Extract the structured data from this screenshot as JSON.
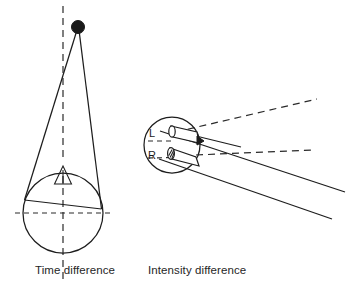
{
  "figure": {
    "background_color": "#ffffff",
    "ink_color": "#1d1d1d",
    "width": 360,
    "height": 287
  },
  "panels": [
    {
      "id": "time-difference",
      "caption": "Time difference",
      "caption_position": {
        "x": 35,
        "y": 272
      },
      "description": "Sound source above a head seen from above; two path lines of unequal length reach the two ears",
      "elements": {
        "source_dot": {
          "name": "sound-source-dot",
          "cx": 78,
          "cy": 27,
          "r": 6.5,
          "color": "#1a1a1a"
        },
        "midline": {
          "name": "vertical-midline",
          "x": 63,
          "y1": 6,
          "y2": 283,
          "style": "dashed"
        },
        "head_circle": {
          "name": "head-outline",
          "cx": 63,
          "cy": 213,
          "r": 40,
          "style": "solid"
        },
        "horizontal_axis": {
          "name": "interaural-axis",
          "y": 213,
          "x1": 15,
          "x2": 112,
          "style": "dashed"
        },
        "nose_triangle": {
          "name": "nose-marker",
          "apex_x": 63,
          "apex_y": 166,
          "base_left_x": 55,
          "base_right_x": 71,
          "base_y": 183
        },
        "path_left": {
          "name": "sound-path-left-ear",
          "from": [
            78,
            27
          ],
          "to": [
            25,
            199
          ]
        },
        "path_right": {
          "name": "sound-path-right-ear",
          "from": [
            78,
            27
          ],
          "to": [
            101,
            208
          ]
        },
        "interaural_chord": {
          "name": "interaural-chord",
          "from": [
            25,
            199
          ],
          "to": [
            101,
            208
          ]
        }
      }
    },
    {
      "id": "intensity-difference",
      "caption": "Intensity difference",
      "caption_position": {
        "x": 148,
        "y": 272
      },
      "description": "Head seen from above with L and R ear cones; solid and dashed rays spread to the right showing head-shadow intensity differences",
      "elements": {
        "head_circle": {
          "name": "head-outline",
          "cx": 172,
          "cy": 145,
          "r": 28,
          "style": "solid"
        },
        "ear_left": {
          "name": "left-ear-cone",
          "label": "L",
          "shaded": false,
          "label_x": 156,
          "label_y": 133
        },
        "ear_right": {
          "name": "right-ear-cone",
          "label": "R",
          "shaded": true,
          "label_x": 156,
          "label_y": 155
        },
        "rays_solid_count": 3,
        "rays_dashed_count": 3
      },
      "labels": [
        {
          "text": "L",
          "name": "left-ear-label",
          "x": 156,
          "y": 133
        },
        {
          "text": "R",
          "name": "right-ear-label",
          "x": 156,
          "y": 155
        }
      ],
      "rays": [
        {
          "name": "ray-upper-solid",
          "style": "solid",
          "from": [
            193,
            135
          ],
          "to": [
            345,
            192
          ]
        },
        {
          "name": "ray-mid-solid",
          "style": "solid",
          "from": [
            160,
            130
          ],
          "to": [
            238,
            148
          ]
        },
        {
          "name": "ray-lower-solid",
          "style": "solid",
          "from": [
            186,
            162
          ],
          "to": [
            332,
            219
          ]
        },
        {
          "name": "ray-upper-dashed",
          "style": "dashed",
          "from": [
            175,
            133
          ],
          "to": [
            317,
            99
          ]
        },
        {
          "name": "ray-mid-dashed",
          "style": "dashed",
          "from": [
            160,
            152
          ],
          "to": [
            312,
            150
          ]
        },
        {
          "name": "ray-inner-dashed",
          "style": "dashed",
          "from": [
            150,
            142
          ],
          "to": [
            200,
            143
          ]
        }
      ]
    }
  ],
  "captions": {
    "left": "Time difference",
    "right": "Intensity difference"
  }
}
